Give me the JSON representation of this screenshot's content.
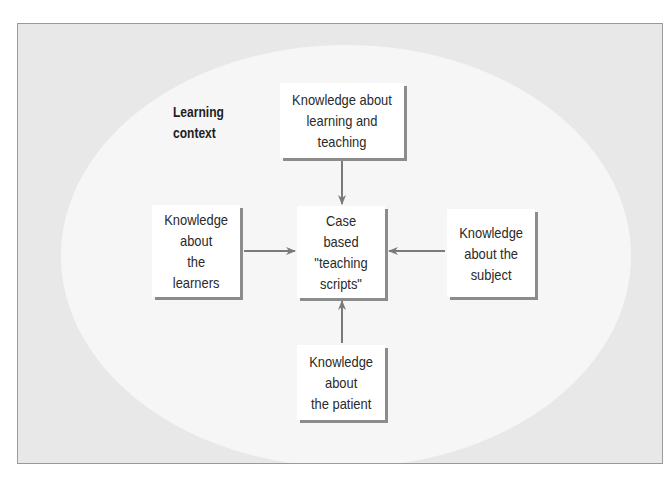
{
  "diagram": {
    "context_label": "Learning\ncontext",
    "center_node": {
      "label": "Case\nbased\n\"teaching\nscripts\""
    },
    "nodes": [
      {
        "id": "top",
        "label": "Knowledge about\nlearning and\nteaching"
      },
      {
        "id": "left",
        "label": "Knowledge\nabout\nthe\nlearners"
      },
      {
        "id": "right",
        "label": "Knowledge\nabout the\nsubject"
      },
      {
        "id": "bottom",
        "label": "Knowledge\nabout\nthe patient"
      }
    ],
    "edges": [
      {
        "from": "top",
        "to": "center"
      },
      {
        "from": "left",
        "to": "center"
      },
      {
        "from": "right",
        "to": "center"
      },
      {
        "from": "bottom",
        "to": "center"
      }
    ],
    "colors": {
      "frame_bg": "#e8e8e8",
      "ellipse_bg": "#f6f6f6",
      "box_shadow": "#8c8c8c",
      "arrow": "#7a7a7a",
      "text": "#2a2a2a"
    }
  }
}
